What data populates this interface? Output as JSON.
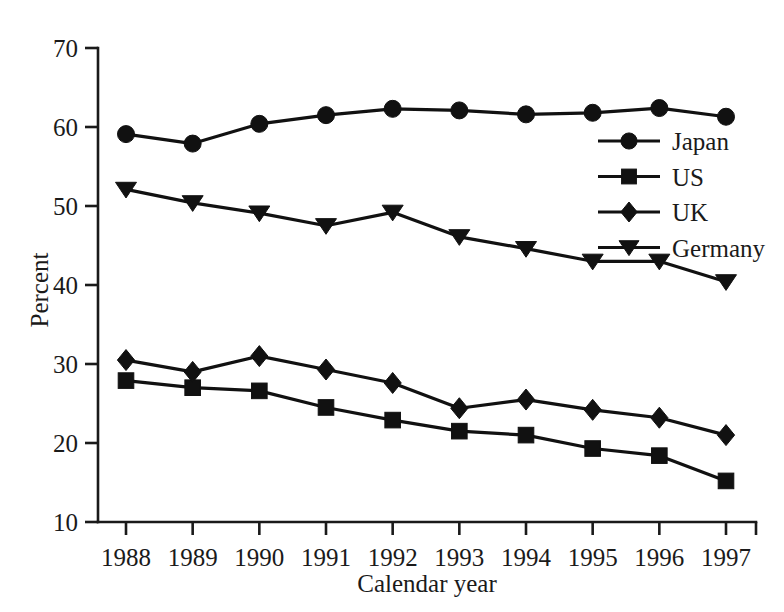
{
  "chart_data": {
    "type": "line",
    "title": "",
    "xlabel": "Calendar year",
    "ylabel": "Percent",
    "categories": [
      "1988",
      "1989",
      "1990",
      "1991",
      "1992",
      "1993",
      "1994",
      "1995",
      "1996",
      "1997"
    ],
    "x": [
      1988,
      1989,
      1990,
      1991,
      1992,
      1993,
      1994,
      1995,
      1996,
      1997
    ],
    "xlim": [
      1988,
      1997
    ],
    "ylim": [
      10,
      70
    ],
    "ytick_labels": [
      "70",
      "60",
      "50",
      "40",
      "30",
      "20",
      "10"
    ],
    "yticks": [
      70,
      60,
      50,
      40,
      30,
      20,
      10
    ],
    "grid": false,
    "legend_position": "center-right",
    "series": [
      {
        "name": "Japan",
        "marker": "circle",
        "color": "#111111",
        "values": [
          59.1,
          57.9,
          60.4,
          61.5,
          62.3,
          62.1,
          61.6,
          61.8,
          62.4,
          61.3
        ]
      },
      {
        "name": "US",
        "marker": "square",
        "color": "#111111",
        "values": [
          27.9,
          27.0,
          26.6,
          24.5,
          22.9,
          21.5,
          21.0,
          19.3,
          18.4,
          15.2
        ]
      },
      {
        "name": "UK",
        "marker": "diamond",
        "color": "#111111",
        "values": [
          30.5,
          29.0,
          31.0,
          29.3,
          27.6,
          24.4,
          25.5,
          24.2,
          23.2,
          21.0
        ]
      },
      {
        "name": "Germany",
        "marker": "triangle-down",
        "color": "#111111",
        "values": [
          52.1,
          50.4,
          49.1,
          47.5,
          49.2,
          46.1,
          44.6,
          43.0,
          43.0,
          40.4
        ]
      }
    ]
  },
  "axes": {
    "y_title": "Percent",
    "x_title": "Calendar year"
  },
  "legend": {
    "entries": [
      {
        "label": "Japan"
      },
      {
        "label": "US"
      },
      {
        "label": "UK"
      },
      {
        "label": "Germany"
      }
    ]
  }
}
